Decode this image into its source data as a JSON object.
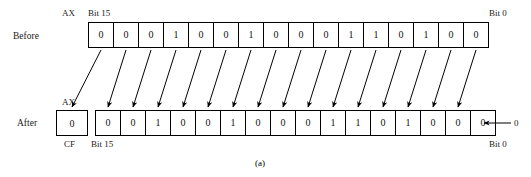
{
  "figure": {
    "caption": "(a)",
    "register_name": "AX",
    "carry_flag_name": "CF",
    "msb_label": "Bit 15",
    "lsb_label": "Bit 0",
    "shift_in_value": "0"
  },
  "before": {
    "row_label": "Before",
    "register_name": "AX",
    "msb_label": "Bit 15",
    "lsb_label": "Bit 0",
    "bits": [
      "0",
      "0",
      "0",
      "1",
      "0",
      "0",
      "1",
      "0",
      "0",
      "0",
      "1",
      "1",
      "0",
      "1",
      "0",
      "0"
    ]
  },
  "after": {
    "row_label": "After",
    "register_name": "AX",
    "carry_flag_name": "CF",
    "carry_flag_value": "0",
    "msb_label": "Bit 15",
    "lsb_label": "Bit 0",
    "bits": [
      "0",
      "0",
      "1",
      "0",
      "0",
      "1",
      "0",
      "0",
      "0",
      "1",
      "1",
      "0",
      "1",
      "0",
      "0",
      "0"
    ],
    "shift_in_value": "0"
  },
  "colors": {
    "ink": "#000000",
    "paper": "#ffffff"
  }
}
